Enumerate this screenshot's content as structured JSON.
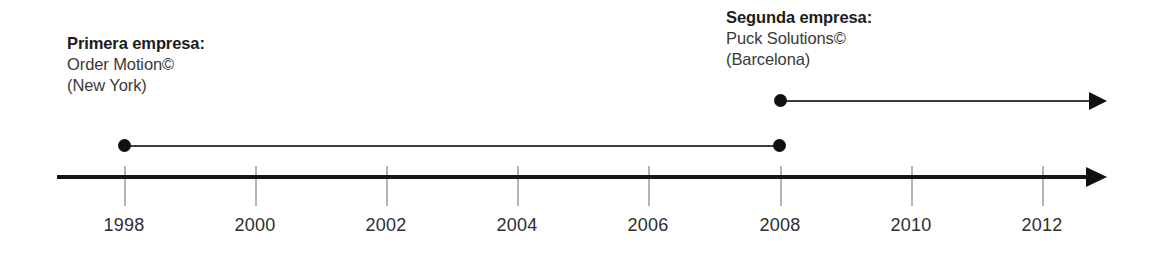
{
  "diagram": {
    "type": "timeline",
    "title": "",
    "background_color": "#ffffff",
    "axis": {
      "line_color": "#161616",
      "arrow_direction": "right",
      "tick_color": "#b4b4b4",
      "start_year": 1998,
      "end_year": 2013,
      "tick_years": [
        1998,
        2000,
        2002,
        2004,
        2006,
        2008,
        2010,
        2012
      ],
      "tick_labels": [
        "1998",
        "2000",
        "2002",
        "2004",
        "2006",
        "2008",
        "2010",
        "2012"
      ]
    },
    "annotations": [
      {
        "id": "first",
        "title": "Primera empresa:",
        "name": "Order Motion©",
        "location": "(New York)"
      },
      {
        "id": "second",
        "title": "Segunda empresa:",
        "name": "Puck Solutions©",
        "location": "(Barcelona)"
      }
    ],
    "events": [
      {
        "id": "first",
        "label": "Order Motion© (New York)",
        "start_year": 1998,
        "end_year": 2008,
        "start_marker": "dot",
        "end_marker": "dot",
        "ongoing": false,
        "color": "#111111"
      },
      {
        "id": "second",
        "label": "Puck Solutions© (Barcelona)",
        "start_year": 2008,
        "end_year": 2012.7,
        "start_marker": "dot",
        "end_marker": "arrow",
        "ongoing": true,
        "color": "#111111"
      }
    ]
  }
}
